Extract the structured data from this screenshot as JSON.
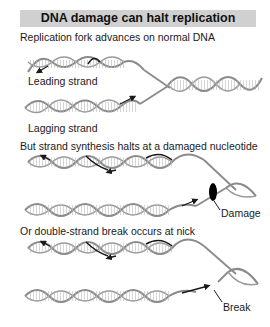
{
  "title": "DNA damage can halt replication",
  "panels": [
    {
      "caption": "Replication fork advances on normal DNA",
      "labels": {
        "top_strand": "Leading strand",
        "bottom_strand": "Lagging strand"
      }
    },
    {
      "caption": "But strand synthesis halts at a damaged nucleotide",
      "labels": {
        "marker": "Damage"
      }
    },
    {
      "caption": "Or double-strand break occurs at nick",
      "labels": {
        "marker": "Break"
      }
    }
  ],
  "colors": {
    "title_bar": "#d0d0d0",
    "helix_strand": "#8a8a8a",
    "new_strand": "#1a1a1a",
    "damage": "#000000"
  }
}
